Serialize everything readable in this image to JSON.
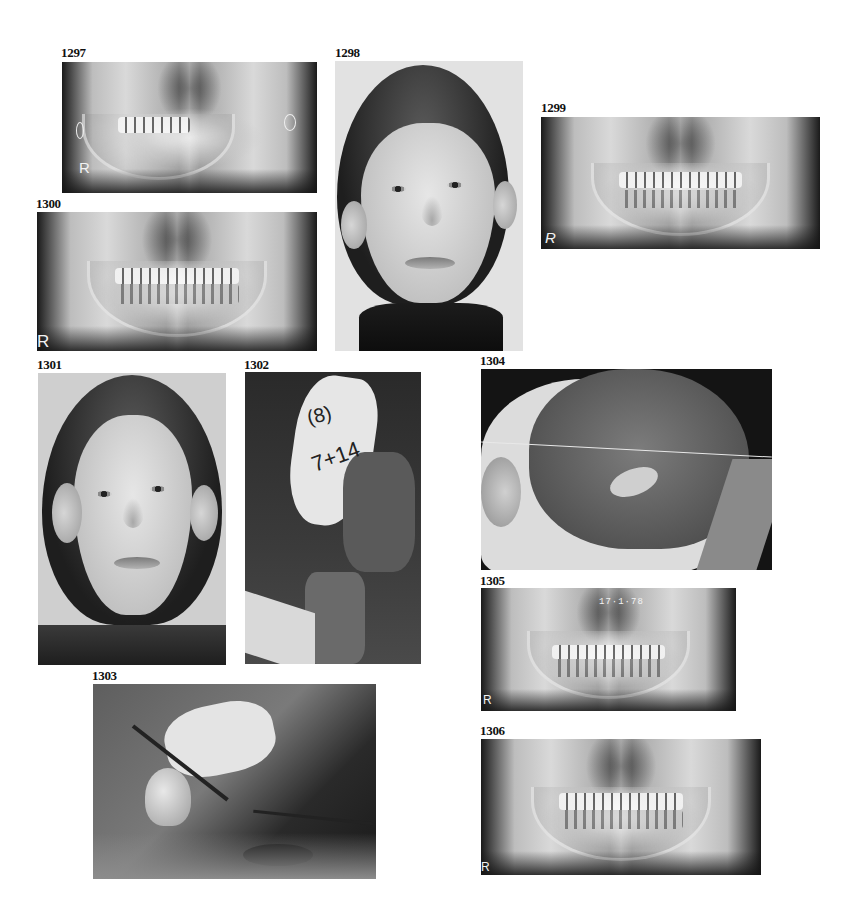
{
  "figures": [
    {
      "id": "1297",
      "label": "1297",
      "type": "panoramic-radiograph",
      "markers": [
        "R",
        "O"
      ]
    },
    {
      "id": "1298",
      "label": "1298",
      "type": "frontal-portrait-photograph"
    },
    {
      "id": "1299",
      "label": "1299",
      "type": "panoramic-radiograph",
      "markers": [
        "R"
      ]
    },
    {
      "id": "1300",
      "label": "1300",
      "type": "panoramic-radiograph",
      "markers": [
        "R"
      ]
    },
    {
      "id": "1301",
      "label": "1301",
      "type": "frontal-portrait-photograph"
    },
    {
      "id": "1302",
      "label": "1302",
      "type": "intraoperative-photograph",
      "annotations": [
        "(8)",
        "7+14"
      ]
    },
    {
      "id": "1303",
      "label": "1303",
      "type": "intraoperative-photograph"
    },
    {
      "id": "1304",
      "label": "1304",
      "type": "intraoperative-photograph"
    },
    {
      "id": "1305",
      "label": "1305",
      "type": "panoramic-radiograph",
      "markers": [
        "R"
      ],
      "date_stamp": "17·1·78"
    },
    {
      "id": "1306",
      "label": "1306",
      "type": "panoramic-radiograph",
      "markers": [
        "R"
      ]
    }
  ]
}
